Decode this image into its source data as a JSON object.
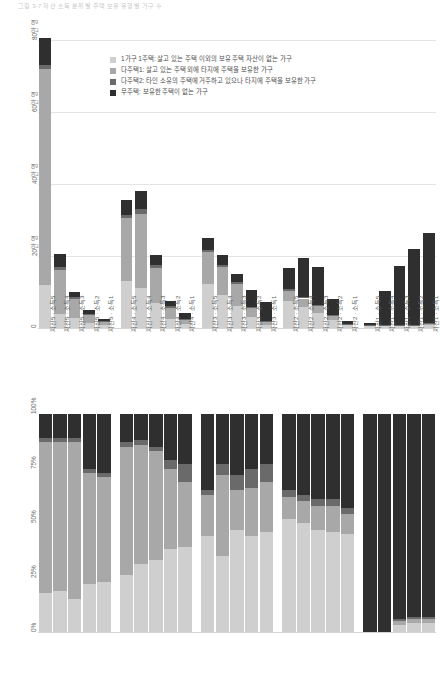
{
  "header": {
    "text": "그림 3-7 자산·소득 분위별 주택 보유 유형별 가구 수"
  },
  "legend": {
    "items": [
      {
        "label": "1가구 1주택: 살고 있는 주택 이외의 보유 주택 자산이 없는 가구",
        "color": "#cfcfcf"
      },
      {
        "label": "다주택1: 살고 있는 주택 외에 타지에 주택을 보유한 가구",
        "color": "#a8a8a8"
      },
      {
        "label": "다주택2: 타인 소유의 주택에 거주하고 있으나 타지에 주택을 보유한 가구",
        "color": "#6a6a6a"
      },
      {
        "label": "무주택: 보유한 주택이 없는 가구",
        "color": "#2f2f2f"
      }
    ]
  },
  "chart_data": [
    {
      "id": "counts",
      "type": "bar",
      "stacked": true,
      "title": "",
      "xlabel": "",
      "ylabel": "",
      "ylim": [
        0,
        800000
      ],
      "grid": true,
      "legend_position": "inside-top-right",
      "ytick_labels": [
        "0",
        "20만 명",
        "40만 명",
        "60만 명",
        "80만 명"
      ],
      "ytick_values": [
        0,
        200000,
        400000,
        600000,
        800000
      ],
      "categories": [
        "자산5 · 소득5",
        "자산5 · 소득4",
        "자산5 · 소득3",
        "자산5 · 소득2",
        "자산5 · 소득1",
        "자산4 · 소득5",
        "자산4 · 소득4",
        "자산4 · 소득3",
        "자산4 · 소득2",
        "자산4 · 소득1",
        "자산3 · 소득5",
        "자산3 · 소득4",
        "자산3 · 소득3",
        "자산3 · 소득2",
        "자산3 · 소득1",
        "자산2 · 소득5",
        "자산2 · 소득4",
        "자산2 · 소득3",
        "자산2 · 소득2",
        "자산2 · 소득1",
        "자산1 · 소득5",
        "자산1 · 소득4",
        "자산1 · 소득3",
        "자산1 · 소득2",
        "자산1 · 소득1"
      ],
      "series": [
        {
          "name": "1가구 1주택",
          "color": "#cfcfcf",
          "values": [
            120000,
            40000,
            28000,
            14000,
            7000,
            130000,
            110000,
            70000,
            26000,
            12000,
            122000,
            92000,
            62000,
            30000,
            9000,
            76000,
            58000,
            42000,
            22000,
            7000,
            6000,
            5000,
            5000,
            6000,
            9000
          ]
        },
        {
          "name": "다주택1",
          "color": "#a8a8a8",
          "values": [
            600000,
            122000,
            52000,
            22000,
            10000,
            175000,
            208000,
            96000,
            30000,
            12000,
            90000,
            78000,
            60000,
            26000,
            8000,
            28000,
            24000,
            20000,
            12000,
            4000,
            2000,
            2000,
            2000,
            2000,
            3000
          ]
        },
        {
          "name": "다주택2",
          "color": "#6a6a6a",
          "values": [
            10000,
            8000,
            6000,
            4000,
            2000,
            10000,
            12000,
            8000,
            4000,
            2000,
            6000,
            6000,
            5000,
            3000,
            2000,
            4000,
            4000,
            3000,
            2000,
            1000,
            1000,
            1000,
            1000,
            1000,
            1000
          ]
        },
        {
          "name": "무주택",
          "color": "#2f2f2f",
          "values": [
            76000,
            36000,
            14000,
            10000,
            6000,
            40000,
            50000,
            30000,
            14000,
            16000,
            32000,
            26000,
            24000,
            48000,
            54000,
            60000,
            108000,
            104000,
            44000,
            8000,
            6000,
            96000,
            164000,
            210000,
            250000
          ]
        }
      ]
    },
    {
      "id": "shares",
      "type": "bar",
      "stacked": true,
      "normalized": true,
      "title": "",
      "xlabel": "",
      "ylabel": "",
      "ylim": [
        0,
        100
      ],
      "grid": false,
      "ytick_labels": [
        "0%",
        "25%",
        "50%",
        "75%",
        "100%"
      ],
      "ytick_values": [
        0,
        25,
        50,
        75,
        100
      ],
      "categories": [
        "자산5 · 소득5",
        "자산5 · 소득4",
        "자산5 · 소득3",
        "자산5 · 소득2",
        "자산5 · 소득1",
        "자산4 · 소득5",
        "자산4 · 소득4",
        "자산4 · 소득3",
        "자산4 · 소득2",
        "자산4 · 소득1",
        "자산3 · 소득5",
        "자산3 · 소득4",
        "자산3 · 소득3",
        "자산3 · 소득2",
        "자산3 · 소득1",
        "자산2 · 소득5",
        "자산2 · 소득4",
        "자산2 · 소득3",
        "자산2 · 소득2",
        "자산2 · 소득1",
        "자산1 · 소득5",
        "자산1 · 소득4",
        "자산1 · 소득3",
        "자산1 · 소득2",
        "자산1 · 소득1"
      ],
      "series": [
        {
          "name": "1가구 1주택",
          "color": "#cfcfcf",
          "values": [
            18,
            19,
            15,
            22,
            23,
            26,
            31,
            33,
            38,
            39,
            44,
            35,
            47,
            44,
            46,
            52,
            50,
            47,
            46,
            45,
            0,
            0,
            3,
            4,
            4
          ]
        },
        {
          "name": "다주택1",
          "color": "#a8a8a8",
          "values": [
            69,
            68,
            72,
            51,
            48,
            59,
            55,
            50,
            37,
            30,
            19,
            37,
            18,
            22,
            23,
            10,
            10,
            11,
            12,
            9,
            0,
            0,
            2,
            2,
            2
          ]
        },
        {
          "name": "다주택2",
          "color": "#6a6a6a",
          "values": [
            2,
            2,
            2,
            2,
            2,
            2,
            2,
            2,
            4,
            8,
            2,
            5,
            7,
            9,
            8,
            3,
            3,
            3,
            3,
            3,
            0,
            0,
            1,
            1,
            1
          ]
        },
        {
          "name": "무주택",
          "color": "#2f2f2f",
          "values": [
            11,
            11,
            11,
            25,
            27,
            13,
            12,
            15,
            21,
            23,
            35,
            23,
            28,
            25,
            23,
            35,
            37,
            39,
            39,
            43,
            100,
            100,
            94,
            93,
            93
          ]
        }
      ]
    }
  ]
}
